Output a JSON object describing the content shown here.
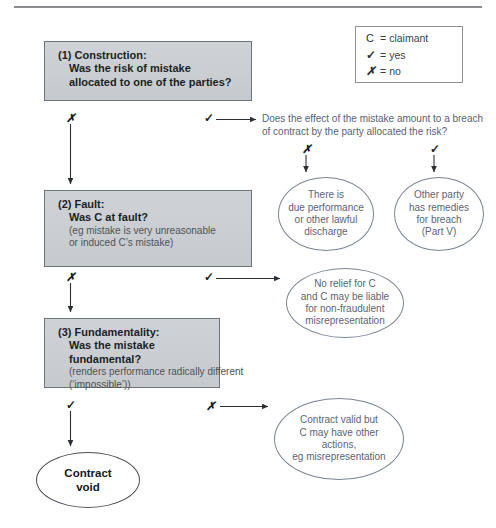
{
  "legend": {
    "rows": [
      {
        "symbol": "C",
        "eq": "=",
        "label": "claimant",
        "kind": "letter"
      },
      {
        "symbol": "✓",
        "eq": "=",
        "label": "yes",
        "kind": "tick"
      },
      {
        "symbol": "✗",
        "eq": "=",
        "label": "no",
        "kind": "cross"
      }
    ]
  },
  "markers": {
    "no": "✗",
    "yes": "✓"
  },
  "boxes": {
    "box1": {
      "heading": "(1) Construction:",
      "line2": "Was the risk of mistake",
      "line3": "allocated to one of the parties?"
    },
    "box2": {
      "heading": "(2) Fault:",
      "line2": "Was C at fault?",
      "note1": "(eg mistake is very unreasonable",
      "note2": "or induced  C’s mistake)"
    },
    "box3": {
      "heading": "(3) Fundamentality:",
      "line2": "Was the mistake",
      "line3": "fundamental?",
      "note1": "(renders performance radically different",
      "note2": "(‘impossible’))"
    }
  },
  "question": {
    "line1": "Does the effect of the mistake amount to a breach",
    "line2": "of contract by the party allocated the risk?"
  },
  "outcomes": {
    "discharge": {
      "line1": "There is",
      "line2": "due performance",
      "line3": "or other lawful",
      "line4": "discharge"
    },
    "remedies": {
      "line1": "Other party",
      "line2": "has remedies",
      "line3": "for breach",
      "line4": "(Part V)"
    },
    "norelief": {
      "line1": "No relief for C",
      "line2": "and C may be liable",
      "line3": "for non-fraudulent",
      "line4": "misrepresentation"
    },
    "validbut": {
      "line1": "Contract valid but",
      "line2": "C may have other actions,",
      "line3": "eg misrepresentation"
    },
    "void": {
      "line1": "Contract",
      "line2": "void"
    }
  },
  "colors": {
    "box_fill": "#cbcfd3",
    "box_border": "#6f7478",
    "ellipse_border": "#7d8592",
    "ellipse_text": "#5b6475",
    "heading_text": "#1b1f24",
    "note_text": "#4d5257",
    "rule": "#8c8c90"
  }
}
